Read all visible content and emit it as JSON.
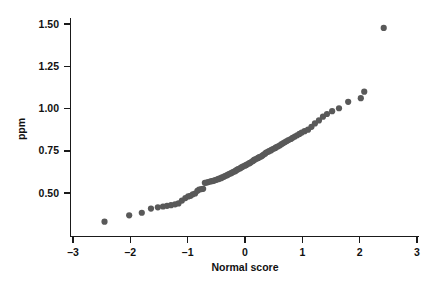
{
  "chart_data": {
    "type": "scatter",
    "title": "",
    "xlabel": "Normal score",
    "ylabel": "ppm",
    "xlim": [
      -3.3,
      3.3
    ],
    "ylim": [
      0.3,
      1.58
    ],
    "grid": false,
    "legend": null,
    "xticks": [
      "-3",
      "-2",
      "-1",
      "0",
      "1",
      "2",
      "3"
    ],
    "xtick_values": [
      -3,
      -2,
      -1,
      0,
      1,
      2,
      3
    ],
    "yticks": [
      "0.50",
      "0.75",
      "1.00",
      "1.25",
      "1.50"
    ],
    "ytick_values": [
      0.5,
      0.75,
      1.0,
      1.25,
      1.5
    ],
    "marker_color": "#595959",
    "marker_size": 3.1,
    "series": [
      {
        "name": "Normal probability plot",
        "points": [
          [
            -2.45,
            0.33
          ],
          [
            -2.02,
            0.368
          ],
          [
            -1.8,
            0.383
          ],
          [
            -1.64,
            0.408
          ],
          [
            -1.52,
            0.415
          ],
          [
            -1.43,
            0.42
          ],
          [
            -1.36,
            0.424
          ],
          [
            -1.29,
            0.428
          ],
          [
            -1.22,
            0.433
          ],
          [
            -1.16,
            0.438
          ],
          [
            -1.1,
            0.455
          ],
          [
            -1.04,
            0.47
          ],
          [
            -0.99,
            0.48
          ],
          [
            -0.95,
            0.483
          ],
          [
            -0.91,
            0.492
          ],
          [
            -0.87,
            0.497
          ],
          [
            -0.83,
            0.513
          ],
          [
            -0.8,
            0.52
          ],
          [
            -0.76,
            0.523
          ],
          [
            -0.73,
            0.525
          ],
          [
            -0.7,
            0.56
          ],
          [
            -0.67,
            0.562
          ],
          [
            -0.64,
            0.565
          ],
          [
            -0.61,
            0.568
          ],
          [
            -0.58,
            0.57
          ],
          [
            -0.55,
            0.572
          ],
          [
            -0.53,
            0.575
          ],
          [
            -0.5,
            0.578
          ],
          [
            -0.47,
            0.582
          ],
          [
            -0.45,
            0.585
          ],
          [
            -0.42,
            0.588
          ],
          [
            -0.4,
            0.592
          ],
          [
            -0.37,
            0.596
          ],
          [
            -0.35,
            0.6
          ],
          [
            -0.32,
            0.604
          ],
          [
            -0.3,
            0.608
          ],
          [
            -0.28,
            0.612
          ],
          [
            -0.25,
            0.616
          ],
          [
            -0.23,
            0.62
          ],
          [
            -0.21,
            0.624
          ],
          [
            -0.18,
            0.628
          ],
          [
            -0.16,
            0.632
          ],
          [
            -0.14,
            0.637
          ],
          [
            -0.12,
            0.641
          ],
          [
            -0.09,
            0.645
          ],
          [
            -0.07,
            0.65
          ],
          [
            -0.05,
            0.654
          ],
          [
            -0.03,
            0.658
          ],
          [
            0.0,
            0.662
          ],
          [
            0.02,
            0.666
          ],
          [
            0.04,
            0.67
          ],
          [
            0.07,
            0.675
          ],
          [
            0.09,
            0.679
          ],
          [
            0.11,
            0.683
          ],
          [
            0.14,
            0.69
          ],
          [
            0.16,
            0.696
          ],
          [
            0.18,
            0.7
          ],
          [
            0.21,
            0.704
          ],
          [
            0.23,
            0.708
          ],
          [
            0.25,
            0.712
          ],
          [
            0.28,
            0.716
          ],
          [
            0.3,
            0.72
          ],
          [
            0.32,
            0.726
          ],
          [
            0.35,
            0.733
          ],
          [
            0.37,
            0.74
          ],
          [
            0.4,
            0.744
          ],
          [
            0.42,
            0.748
          ],
          [
            0.45,
            0.752
          ],
          [
            0.47,
            0.757
          ],
          [
            0.5,
            0.762
          ],
          [
            0.53,
            0.767
          ],
          [
            0.55,
            0.772
          ],
          [
            0.58,
            0.777
          ],
          [
            0.61,
            0.783
          ],
          [
            0.64,
            0.79
          ],
          [
            0.67,
            0.796
          ],
          [
            0.7,
            0.802
          ],
          [
            0.73,
            0.808
          ],
          [
            0.76,
            0.814
          ],
          [
            0.8,
            0.82
          ],
          [
            0.83,
            0.827
          ],
          [
            0.87,
            0.834
          ],
          [
            0.91,
            0.842
          ],
          [
            0.95,
            0.85
          ],
          [
            0.99,
            0.858
          ],
          [
            1.04,
            0.866
          ],
          [
            1.1,
            0.875
          ],
          [
            1.16,
            0.892
          ],
          [
            1.22,
            0.912
          ],
          [
            1.29,
            0.93
          ],
          [
            1.36,
            0.952
          ],
          [
            1.43,
            0.968
          ],
          [
            1.52,
            0.985
          ],
          [
            1.64,
            1.002
          ],
          [
            1.8,
            1.04
          ],
          [
            2.02,
            1.062
          ],
          [
            2.08,
            1.1
          ],
          [
            2.42,
            1.478
          ]
        ]
      }
    ],
    "annotations": [
      {
        "text": "outlier",
        "x": 2.42,
        "y": 1.478
      }
    ]
  },
  "axes": {
    "y_axis_label": "ppm",
    "x_axis_label": "Normal score"
  }
}
